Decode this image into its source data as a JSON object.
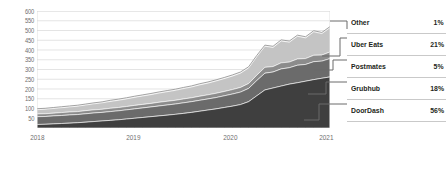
{
  "chart_data": {
    "type": "area",
    "stacked": true,
    "title": "",
    "subtitle": "",
    "xlabel": "",
    "ylabel": "",
    "grid": true,
    "legend_position": "right",
    "ylim": [
      0,
      600
    ],
    "yticks": [
      600,
      550,
      500,
      450,
      400,
      350,
      300,
      250,
      200,
      150,
      100,
      50
    ],
    "xticks": [
      "2018",
      "2019",
      "2020",
      "2021"
    ],
    "x": [
      2018.0,
      2018.083,
      2018.167,
      2018.25,
      2018.333,
      2018.417,
      2018.5,
      2018.583,
      2018.667,
      2018.75,
      2018.833,
      2018.917,
      2019.0,
      2019.083,
      2019.167,
      2019.25,
      2019.333,
      2019.417,
      2019.5,
      2019.583,
      2019.667,
      2019.75,
      2019.833,
      2019.917,
      2020.0,
      2020.083,
      2020.167,
      2020.25,
      2020.333,
      2020.417,
      2020.5,
      2020.583,
      2020.667,
      2020.75,
      2020.833,
      2020.917,
      2021.0
    ],
    "series": [
      {
        "name": "DoorDash",
        "share_pct": 56,
        "color": "#3f3f3f",
        "values": [
          18,
          19,
          21,
          23,
          25,
          27,
          30,
          33,
          36,
          39,
          42,
          46,
          50,
          54,
          58,
          62,
          66,
          70,
          75,
          80,
          86,
          92,
          98,
          105,
          112,
          120,
          135,
          165,
          195,
          205,
          215,
          225,
          232,
          240,
          248,
          255,
          262
        ]
      },
      {
        "name": "Grubhub",
        "share_pct": 18,
        "color": "#6b6b6b",
        "values": [
          40,
          40,
          41,
          41,
          42,
          42,
          43,
          44,
          44,
          45,
          46,
          47,
          48,
          49,
          50,
          51,
          52,
          53,
          54,
          55,
          56,
          57,
          58,
          60,
          62,
          64,
          68,
          78,
          86,
          82,
          88,
          84,
          90,
          86,
          92,
          88,
          94
        ]
      },
      {
        "name": "Postmates",
        "share_pct": 5,
        "color": "#8c8c8c",
        "values": [
          14,
          14,
          14,
          15,
          15,
          15,
          16,
          16,
          16,
          17,
          17,
          17,
          18,
          18,
          18,
          19,
          19,
          19,
          20,
          20,
          21,
          21,
          22,
          22,
          23,
          24,
          25,
          28,
          30,
          28,
          31,
          29,
          32,
          30,
          33,
          31,
          34
        ]
      },
      {
        "name": "Uber Eats",
        "share_pct": 21,
        "color": "#c4c4c4",
        "values": [
          22,
          23,
          24,
          25,
          26,
          28,
          29,
          31,
          33,
          35,
          37,
          39,
          41,
          43,
          45,
          47,
          49,
          51,
          53,
          55,
          58,
          60,
          63,
          66,
          69,
          73,
          80,
          95,
          108,
          98,
          112,
          102,
          116,
          106,
          120,
          110,
          124
        ]
      },
      {
        "name": "Other",
        "share_pct": 1,
        "color": "#ededed",
        "values": [
          5,
          5,
          5,
          5,
          5,
          5,
          5,
          5,
          5,
          6,
          6,
          6,
          6,
          6,
          6,
          6,
          6,
          6,
          6,
          6,
          6,
          6,
          6,
          6,
          6,
          6,
          6,
          6,
          6,
          6,
          6,
          6,
          6,
          6,
          6,
          6,
          6
        ]
      }
    ]
  },
  "legend": {
    "rows": [
      {
        "label": "Other",
        "value": "1%"
      },
      {
        "label": "Uber Eats",
        "value": "21%"
      },
      {
        "label": "Postmates",
        "value": "5%"
      },
      {
        "label": "Grubhub",
        "value": "18%"
      },
      {
        "label": "DoorDash",
        "value": "56%"
      }
    ]
  },
  "colors": {
    "axis_text": "#6f6f6f",
    "grid": "#d8d8d8",
    "legend_text": "#231f20",
    "leader_line": "#6b6b6b"
  }
}
